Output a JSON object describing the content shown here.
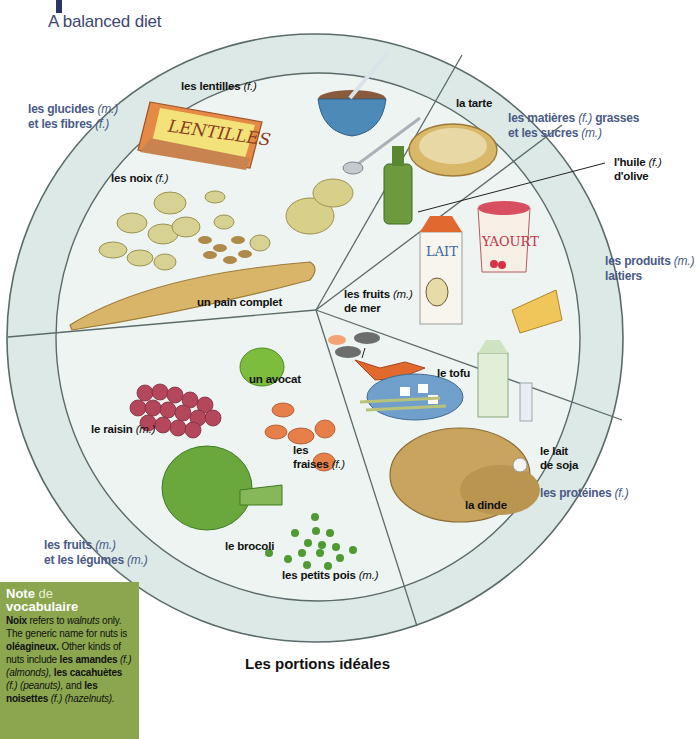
{
  "header": {
    "subtitle": "A balanced diet"
  },
  "plate": {
    "colors": {
      "plate_fill": "#dde9e6",
      "inner_fill": "#eef4f2",
      "line": "#5b6b6a",
      "category_text": "#4a5a86"
    },
    "categories": [
      {
        "id": "glucides",
        "line1": "les glucides",
        "g1": "(m.)",
        "line2": "et les fibres",
        "g2": "(f.)"
      },
      {
        "id": "matieres",
        "line1": "les matières",
        "g1": "(f.)",
        "line1b": "grasses",
        "line2": "et les sucres",
        "g2": "(m.)"
      },
      {
        "id": "laitiers",
        "line1": "les produits",
        "g1": "(m.)",
        "line2": "laitiers"
      },
      {
        "id": "proteines",
        "line1": "les protéines",
        "g1": "(f.)"
      },
      {
        "id": "fruits",
        "line1": "les fruits",
        "g1": "(m.)",
        "line2": "et les légumes",
        "g2": "(m.)"
      }
    ],
    "foods": {
      "lentilles": {
        "text": "les lentilles",
        "g": "(f.)"
      },
      "noix": {
        "text": "les noix",
        "g": "(f.)"
      },
      "pain": {
        "text": "un pain complet"
      },
      "tarte": {
        "text": "la tarte"
      },
      "huile_1": {
        "text": "l'huile",
        "g": "(f.)"
      },
      "huile_2": {
        "text": "d'olive"
      },
      "fruits_mer_1": {
        "text": "les fruits",
        "g": "(m.)"
      },
      "fruits_mer_2": {
        "text": "de mer"
      },
      "tofu": {
        "text": "le tofu"
      },
      "lait_soja_1": {
        "text": "le lait"
      },
      "lait_soja_2": {
        "text": "de soja"
      },
      "dinde": {
        "text": "la dinde"
      },
      "avocat": {
        "text": "un avocat"
      },
      "raisin": {
        "text": "le raisin",
        "g": "(m.)"
      },
      "fraises_1": {
        "text": "les"
      },
      "fraises_2": {
        "text": "fraises",
        "g": "(f.)"
      },
      "brocoli": {
        "text": "le brocoli"
      },
      "petits_pois": {
        "text": "les petits pois",
        "g": "(m.)"
      }
    },
    "illustration_text": {
      "lentilles_bag": "LENTILLES",
      "lait_carton": "LAIT",
      "yaourt_pot": "YAOURT"
    }
  },
  "caption": "Les portions idéales",
  "note": {
    "title_bold": "Note",
    "title_light": "de",
    "title_line2": "vocabulaire",
    "b1": "Noix",
    "t1": " refers to ",
    "i1": "walnuts",
    "t2": " only. The generic name for nuts is ",
    "b2": "oléagineux.",
    "t3": " Other kinds of nuts include ",
    "b3": "les amandes",
    "i2": " (f.) (almonds),",
    "b4": "les cacahuètes",
    "i3": " (f.) (peanuts),",
    "t4": " and ",
    "b5": "les noisettes",
    "i4": " (f.) (hazelnuts)."
  }
}
